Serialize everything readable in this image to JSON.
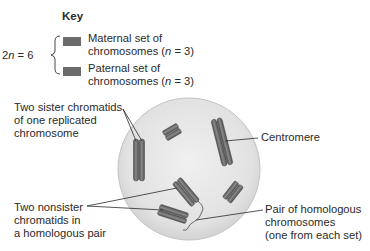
{
  "key": {
    "title": "Key",
    "ploidy_label_prefix": "2n = 6",
    "items": [
      {
        "line1": "Maternal set of",
        "line2": "chromosomes (n = 3)",
        "color": "#6b6b6b"
      },
      {
        "line1": "Paternal set of",
        "line2": "chromosomes (n = 3)",
        "color": "#6b6b6b"
      }
    ]
  },
  "labels": {
    "sister_chromatids": [
      "Two sister chromatids",
      "of one replicated",
      "chromosome"
    ],
    "nonsister_chromatids": [
      "Two nonsister",
      "chromatids in",
      "a homologous pair"
    ],
    "centromere": [
      "Centromere"
    ],
    "homologous_pair": [
      "Pair of homologous",
      "chromosomes",
      "(one from each set)"
    ]
  },
  "colors": {
    "cell_fill": "#e4e4e4",
    "cell_edge": "#c8c8c8",
    "chromatid": "#6e6e6e",
    "chromatid_dark": "#4e4e4e",
    "leader_line": "#2a2a2a"
  }
}
